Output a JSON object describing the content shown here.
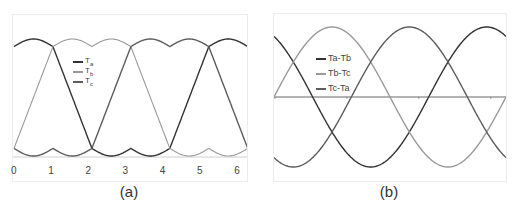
{
  "figure": {
    "captions": {
      "a": "(a)",
      "b": "(b)"
    }
  },
  "chart_data": [
    {
      "type": "line",
      "panel": "(a)",
      "title": "",
      "xlabel": "",
      "ylabel": "",
      "xlim": [
        0,
        6.2832
      ],
      "ylim": [
        0,
        1
      ],
      "x_ticks": [
        "0",
        "1",
        "2",
        "3",
        "4",
        "5",
        "6"
      ],
      "grid": false,
      "legend_position": "upper-center-left",
      "legend": [
        "Ta",
        "Tb",
        "Tc"
      ],
      "colors": {
        "Ta": "#333333",
        "Tb": "#9a9a9a",
        "Tc": "#5c5c5c"
      },
      "description": "Three phase-shifted trapezoidal-like waveforms with scalloped flat tops and bottoms; each phase shifted by 2π/3.",
      "series": [
        {
          "name": "Ta",
          "phase": 0.0,
          "points_x": [
            0,
            0.52,
            1.05,
            2.09,
            2.62,
            3.14,
            3.67,
            4.19,
            5.24,
            5.76,
            6.28
          ],
          "points_y": [
            0.94,
            1.0,
            0.94,
            0.0,
            0.0,
            0.07,
            0.0,
            0.0,
            0.94,
            1.0,
            0.94
          ]
        },
        {
          "name": "Tb",
          "phase": 2.094,
          "points_x": [
            0,
            0.52,
            1.05,
            1.57,
            2.09,
            2.62,
            3.14,
            4.19,
            4.71,
            5.24,
            6.28
          ],
          "points_y": [
            0.07,
            0.0,
            0.94,
            1.0,
            0.94,
            1.0,
            0.94,
            0.0,
            0.0,
            0.07,
            0.07
          ]
        },
        {
          "name": "Tc",
          "phase": 4.189,
          "points_x": [
            0,
            0.52,
            1.05,
            1.57,
            2.09,
            3.14,
            3.67,
            4.19,
            4.71,
            5.24,
            6.28
          ],
          "points_y": [
            0.07,
            0.0,
            0.07,
            0.0,
            0.07,
            0.94,
            1.0,
            0.94,
            1.0,
            0.94,
            0.07
          ]
        }
      ]
    },
    {
      "type": "line",
      "panel": "(b)",
      "title": "",
      "xlabel": "",
      "ylabel": "",
      "xlim": [
        0,
        6.2832
      ],
      "ylim": [
        -1,
        1
      ],
      "x_ticks": [
        "0",
        "1e",
        "2e",
        "3e"
      ],
      "grid": false,
      "legend_position": "upper-left",
      "legend": [
        "Ta-Tb",
        "Tb-Tc",
        "Tc-Ta"
      ],
      "colors": {
        "Ta-Tb": "#333333",
        "Tb-Tc": "#9a9a9a",
        "Tc-Ta": "#5c5c5c"
      },
      "description": "Three sinusoids of equal amplitude, 120° apart, over one period, with a horizontal zero axis.",
      "series": [
        {
          "name": "Ta-Tb",
          "function": "sin(x + 2.094)",
          "values_at": {
            "0": 0.866,
            "1.571": -0.5,
            "3.142": -0.866,
            "4.712": 0.5,
            "6.283": 0.866
          }
        },
        {
          "name": "Tb-Tc",
          "function": "sin(x)",
          "values_at": {
            "0": 0.0,
            "1.571": 1.0,
            "3.142": 0.0,
            "4.712": -1.0,
            "6.283": 0.0
          }
        },
        {
          "name": "Tc-Ta",
          "function": "sin(x - 2.094)",
          "values_at": {
            "0": -0.866,
            "1.571": -0.5,
            "3.142": 0.866,
            "4.712": 0.5,
            "6.283": -0.866
          }
        }
      ]
    }
  ],
  "legend_a": [
    {
      "main": "T",
      "sub": "a",
      "color": "#333333"
    },
    {
      "main": "T",
      "sub": "b",
      "color": "#9a9a9a"
    },
    {
      "main": "T",
      "sub": "c",
      "color": "#5c5c5c"
    }
  ],
  "legend_b": [
    {
      "label": "Ta-Tb",
      "color": "#333333"
    },
    {
      "label": "Tb-Tc",
      "color": "#9a9a9a"
    },
    {
      "label": "Tc-Ta",
      "color": "#5c5c5c"
    }
  ],
  "ticks_a": [
    "0",
    "1",
    "2",
    "3",
    "4",
    "5",
    "6"
  ]
}
